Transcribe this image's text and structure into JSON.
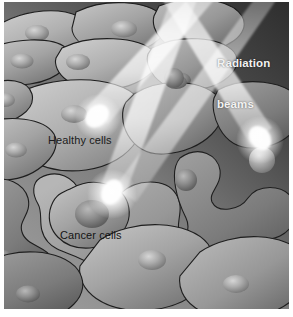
{
  "figure": {
    "width": 293,
    "height": 317,
    "paper_color": "#ffffff"
  },
  "labels": {
    "radiation": "Radiation\nbeams",
    "radiation_line1": "Radiation",
    "radiation_line2": "beams",
    "healthy": "Healthy cells",
    "cancer": "Cancer cells"
  },
  "colors": {
    "background_dark": "#3a3a3a",
    "background_mid": "#8c8c8c",
    "tissue_light": "#b4b4b4",
    "tissue_mid": "#9a9a9a",
    "tissue_dark": "#6f6f6f",
    "cell_outline": "#1c1c1c",
    "nucleus_light": "#c9c9c9",
    "nucleus_dark": "#7a7a7a",
    "beam_body": "#c3c3c3",
    "beam_tip": "#ffffff",
    "label_light": "#f2f2f2",
    "label_dark": "#1b1b1b"
  },
  "elements": {
    "beam_count": 3,
    "beams": [
      {
        "name": "beam-upper-left",
        "target": "cancer cells, left"
      },
      {
        "name": "beam-center",
        "target": "cancer cells, center"
      },
      {
        "name": "beam-right",
        "target": "cancer cells, right"
      }
    ],
    "healthy_cell_count": 12,
    "cancer_cell_count": 8
  }
}
